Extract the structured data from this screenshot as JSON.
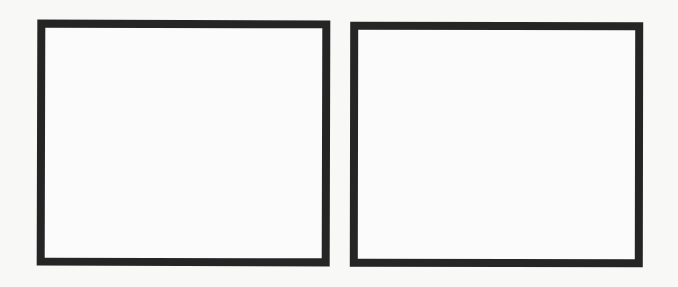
{
  "page": {
    "background_color": "#f8f8f7"
  },
  "frames": [
    {
      "id": "left",
      "border_color": "#252525",
      "fill_color": "#fbfbfb",
      "content": ""
    },
    {
      "id": "right",
      "border_color": "#252525",
      "fill_color": "#fbfbfb",
      "content": ""
    }
  ]
}
